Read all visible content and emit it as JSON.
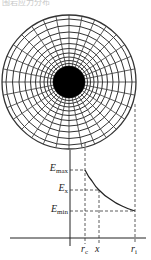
{
  "caption": {
    "text": "围岩应力分布"
  },
  "diagram": {
    "grid": {
      "center": [
        69,
        82
      ],
      "outer_radius": 67,
      "core_radius": 16,
      "ring_radii": [
        16,
        18.5,
        21.5,
        25,
        29,
        33.5,
        38.5,
        44,
        50,
        56.5,
        63,
        67
      ],
      "radial_lines": 32,
      "core_color": "#000000",
      "line_color": "#333333"
    },
    "axes": {
      "y_axis_x": 70,
      "y_axis_top": 150,
      "y_axis_bottom": 246,
      "x_axis_y": 238,
      "x_axis_left": 10,
      "x_axis_right": 146
    },
    "y_labels": [
      {
        "id": "emax",
        "base": "E",
        "sub": "max",
        "y": 170
      },
      {
        "id": "ex",
        "base": "E",
        "sub": "x",
        "y": 190
      },
      {
        "id": "emin",
        "base": "E",
        "sub": "min",
        "y": 211
      }
    ],
    "x_labels": [
      {
        "id": "rc",
        "base": "r",
        "sub": "c",
        "x": 85
      },
      {
        "id": "x",
        "base": "x",
        "sub": "",
        "x": 99
      },
      {
        "id": "ri",
        "base": "r",
        "sub": "i",
        "x": 135
      }
    ],
    "curve": {
      "description": "Elastic modulus decreases from E_max at r_c to E_min at r_i",
      "points": [
        [
          85,
          170
        ],
        [
          92,
          181
        ],
        [
          99,
          190
        ],
        [
          110,
          199
        ],
        [
          122,
          206
        ],
        [
          135,
          211
        ]
      ]
    }
  }
}
